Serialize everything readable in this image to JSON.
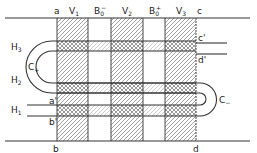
{
  "diagram": {
    "columns": [
      {
        "id": "V1",
        "label": "V",
        "sub": "1",
        "x0": 57,
        "x1": 88,
        "fill": "hatch"
      },
      {
        "id": "B0-",
        "label": "B",
        "sub": "0",
        "sup": "−",
        "x0": 88,
        "x1": 111,
        "fill": "none"
      },
      {
        "id": "V2",
        "label": "V",
        "sub": "2",
        "x0": 111,
        "x1": 143,
        "fill": "hatch"
      },
      {
        "id": "B0+",
        "label": "B",
        "sub": "0",
        "sup": "+",
        "x0": 143,
        "x1": 165,
        "fill": "none"
      },
      {
        "id": "V3",
        "label": "V",
        "sub": "3",
        "x0": 165,
        "x1": 196,
        "fill": "hatch"
      }
    ],
    "bands": [
      {
        "id": "H3",
        "label": "H",
        "sub": "3",
        "y0": 41,
        "y1": 51
      },
      {
        "id": "H2",
        "label": "H",
        "sub": "2",
        "y0": 83,
        "y1": 93
      },
      {
        "id": "H1",
        "label": "H",
        "sub": "1",
        "y0": 105,
        "y1": 116
      }
    ],
    "points": {
      "a": "a",
      "b": "b",
      "c": "c",
      "d": "d",
      "a_prime": "a'",
      "b_prime": "b'",
      "c_prime": "c'",
      "d_prime": "d'"
    },
    "loops": {
      "left": {
        "label": "C",
        "sub": "+"
      },
      "right": {
        "label": "C",
        "sub": "−"
      }
    },
    "band_labels": {
      "H3": {
        "main": "H",
        "sub": "3"
      },
      "H2": {
        "main": "H",
        "sub": "2"
      },
      "H1": {
        "main": "H",
        "sub": "1"
      }
    },
    "column_labels": {
      "V1": {
        "main": "V",
        "sub": "1"
      },
      "B0m": {
        "main": "B",
        "sub": "0",
        "sup": "−"
      },
      "V2": {
        "main": "V",
        "sub": "2"
      },
      "B0p": {
        "main": "B",
        "sub": "0",
        "sup": "+"
      },
      "V3": {
        "main": "V",
        "sub": "3"
      }
    },
    "colors": {
      "line": "#333333",
      "background": "#ffffff",
      "hatch": "#555555"
    }
  }
}
